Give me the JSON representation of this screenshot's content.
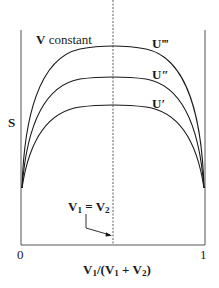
{
  "diagram": {
    "title_label": "V constant",
    "title_bold": "V",
    "title_rest": " constant",
    "y_axis_label": "S",
    "x_axis_label": {
      "v1": "V",
      "s1": "1",
      "mid": "/(",
      "v2": "V",
      "s2": "1",
      "plus": " + ",
      "v3": "V",
      "s3": "2",
      "close": ")"
    },
    "x_tick_left": "0",
    "x_tick_right": "1",
    "annotation": {
      "a": "V",
      "as": "1",
      "eq": " = ",
      "b": "V",
      "bs": "2"
    },
    "curves": [
      {
        "name": "U‴",
        "base": "U",
        "prime": "‴",
        "peak_y": 46
      },
      {
        "name": "U″",
        "base": "U",
        "prime": "″",
        "peak_y": 77
      },
      {
        "name": "U′",
        "base": "U",
        "prime": "′",
        "peak_y": 105
      }
    ],
    "colors": {
      "line": "#1a1a1a",
      "axis": "#555555"
    }
  }
}
